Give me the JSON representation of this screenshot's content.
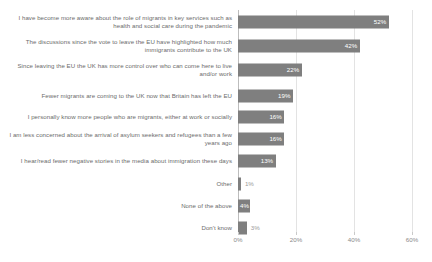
{
  "chart_data": {
    "type": "bar",
    "orientation": "horizontal",
    "title": "",
    "xlabel": "",
    "ylabel": "",
    "xlim": [
      0,
      60
    ],
    "xticks": [
      0,
      20,
      40,
      60
    ],
    "xtick_labels": [
      "0%",
      "20%",
      "40%",
      "60%"
    ],
    "grid": true,
    "legend": "none",
    "bar_color": "#7f7f7f",
    "label_color": "#6b6b6b",
    "gridline_color": "#e3e3e3",
    "categories": [
      "I have become more aware about the role of migrants in key services such as health and social care during the pandemic",
      "The discussions since the vote to leave the EU have highlighted how much immigrants contribute to the UK",
      "Since leaving the EU the UK has more control over who can come here to live and/or work",
      "Fewer migrants are coming to the UK now that Britain has left the EU",
      "I personally know more people who are migrants, either at work or socially",
      "I am less concerned about the arrival of asylum seekers and refugees than a few years ago",
      "I hear/read fewer negative stories in the media about immigration these days",
      "Other",
      "None of the above",
      "Don't know"
    ],
    "values": [
      52,
      42,
      22,
      19,
      16,
      16,
      13,
      1,
      4,
      3
    ],
    "value_labels": [
      "52%",
      "42%",
      "22%",
      "19%",
      "16%",
      "16%",
      "13%",
      "1%",
      "4%",
      "3%"
    ]
  },
  "rows": [
    {
      "label": "I have become more aware about the role of migrants in key services such as health and social care during the pandemic",
      "value": 52,
      "value_label": "52%",
      "label_inside": true,
      "row_height": 24,
      "gap_before": 0
    },
    {
      "label": "The discussions since the vote to leave the EU have highlighted how much immigrants contribute to the UK",
      "value": 42,
      "value_label": "42%",
      "label_inside": true,
      "row_height": 24,
      "gap_before": 0
    },
    {
      "label": "Since leaving the EU the UK has more control over who can come here to live and/or work",
      "value": 22,
      "value_label": "22%",
      "label_inside": true,
      "row_height": 24,
      "gap_before": 0
    },
    {
      "label": "Fewer migrants are coming to the UK now that Britain has left the EU",
      "value": 19,
      "value_label": "19%",
      "label_inside": true,
      "row_height": 20,
      "gap_before": 4
    },
    {
      "label": "I personally know more people who are migrants, either at work or socially",
      "value": 16,
      "value_label": "16%",
      "label_inside": true,
      "row_height": 22,
      "gap_before": 0
    },
    {
      "label": "I am less concerned about the arrival of asylum seekers and refugees than a few years ago",
      "value": 16,
      "value_label": "16%",
      "label_inside": true,
      "row_height": 22,
      "gap_before": 0
    },
    {
      "label": "I hear/read fewer negative stories in the media about immigration these days",
      "value": 13,
      "value_label": "13%",
      "label_inside": true,
      "row_height": 22,
      "gap_before": 0
    },
    {
      "label": "Other",
      "value": 1,
      "value_label": "1%",
      "label_inside": false,
      "row_height": 18,
      "gap_before": 3
    },
    {
      "label": "None of the above",
      "value": 4,
      "value_label": "4%",
      "label_inside": true,
      "row_height": 18,
      "gap_before": 4
    },
    {
      "label": "Don't know",
      "value": 3,
      "value_label": "3%",
      "label_inside": false,
      "row_height": 18,
      "gap_before": 4
    }
  ],
  "axis": {
    "ticks": [
      {
        "value": 0,
        "label": "0%"
      },
      {
        "value": 20,
        "label": "20%"
      },
      {
        "value": 40,
        "label": "40%"
      },
      {
        "value": 60,
        "label": "60%"
      }
    ]
  }
}
